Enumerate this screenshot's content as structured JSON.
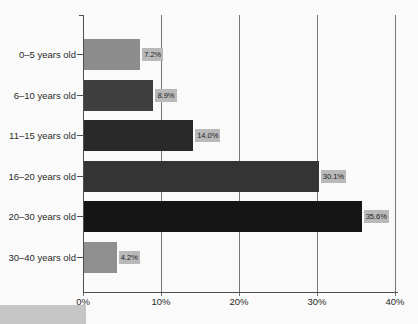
{
  "chart_data": {
    "type": "bar",
    "orientation": "horizontal",
    "title": "",
    "xlabel": "",
    "ylabel": "",
    "categories": [
      "0–5 years old",
      "6–10 years old",
      "11–15 years old",
      "16–20 years old",
      "20–30 years old",
      "30–40 years old"
    ],
    "values": [
      7.2,
      8.9,
      14.0,
      30.1,
      35.6,
      4.2
    ],
    "value_labels": [
      "7.2%",
      "8.9%",
      "14.0%",
      "30.1%",
      "35.6%",
      "4.2%"
    ],
    "bar_colors": [
      "#8d8d8d",
      "#3e3e3e",
      "#292929",
      "#343434",
      "#151515",
      "#8f8f8f"
    ],
    "x_tick_labels": [
      "0%",
      "10%",
      "20%",
      "30%",
      "40%"
    ],
    "x_tick_values": [
      0,
      10,
      20,
      30,
      40
    ],
    "xlim": [
      0,
      40
    ],
    "grid": "vertical",
    "legend": "none",
    "colors": {
      "axis": "#4f4f4f",
      "gridline": "#767676",
      "value_label_bg": "#b9b9b9",
      "value_label_text": "#1d1d1d",
      "category_text": "#2b2b2b",
      "background": "#fafafa"
    }
  },
  "artifacts": {
    "corner_box_color": "#c6c6c6"
  }
}
